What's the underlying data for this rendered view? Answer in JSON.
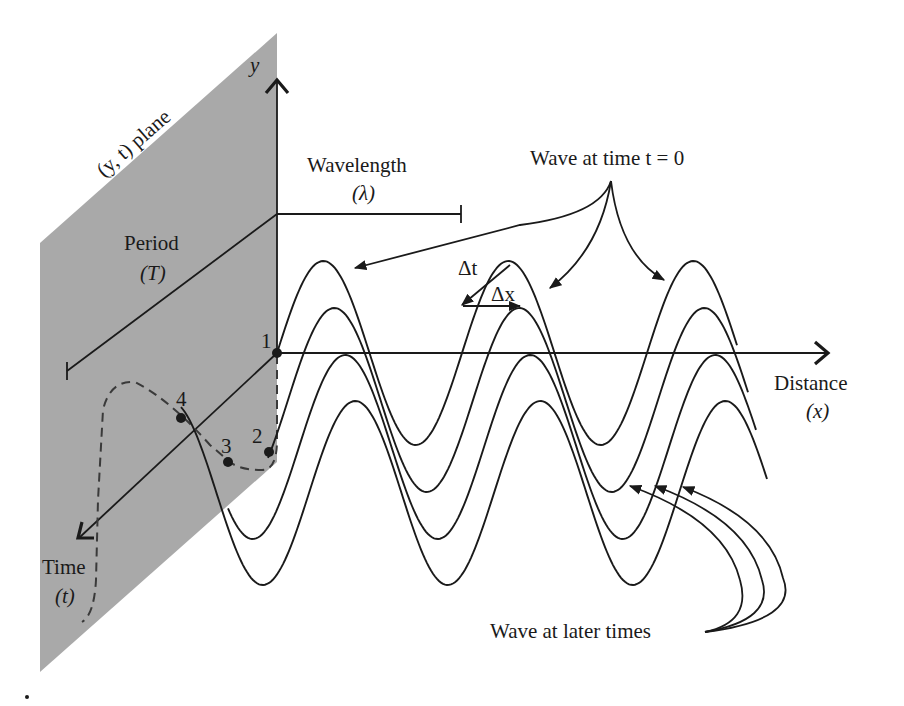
{
  "figure": {
    "type": "travelling wave diagram",
    "plane_label": "(y, t) plane",
    "axes": {
      "y_label": "y",
      "x_label": "Distance",
      "x_symbol": "(x)",
      "t_label": "Time",
      "t_symbol": "(t)"
    },
    "annotations": {
      "wavelength_label": "Wavelength",
      "wavelength_symbol": "(λ)",
      "period_label": "Period",
      "period_symbol": "(T)",
      "wave_t0_label": "Wave at time t = 0",
      "wave_later_label": "Wave at later times",
      "delta_t": "Δt",
      "delta_x": "Δx"
    },
    "points": [
      "1",
      "2",
      "3",
      "4"
    ],
    "waves": [
      {
        "name": "wave-t0",
        "time_index": 0
      },
      {
        "name": "wave-t1",
        "time_index": 1
      },
      {
        "name": "wave-t2",
        "time_index": 2
      },
      {
        "name": "wave-t3",
        "time_index": 3
      }
    ],
    "colors": {
      "plane": "#a9a9a9",
      "ink": "#1a1a1a",
      "background": "#ffffff"
    }
  }
}
